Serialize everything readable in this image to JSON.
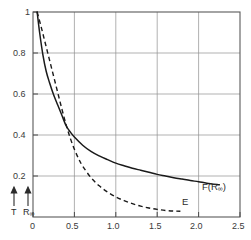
{
  "chart_data": {
    "type": "line",
    "title": "",
    "xlabel": "",
    "ylabel": "",
    "xlim": [
      0,
      2.5
    ],
    "ylim": [
      0,
      1.05
    ],
    "grid": true,
    "legend_position": "inline-right",
    "x_ticks": [
      "0",
      "0.5",
      "1.0",
      "1.5",
      "2.0",
      "2.5"
    ],
    "x_tick_values": [
      0,
      0.5,
      1.0,
      1.5,
      2.0,
      2.5
    ],
    "y_ticks": [
      "0.2",
      "0.4",
      "0.6",
      "0.8",
      "1"
    ],
    "y_tick_values": [
      0.2,
      0.4,
      0.6,
      0.8,
      1.0
    ],
    "series": [
      {
        "name": "F(R∞)",
        "label": "F(R",
        "label_sub": "∞",
        "label_tail": ")",
        "style": "solid",
        "color": "#1a1a1a",
        "x": [
          0.05,
          0.08,
          0.12,
          0.16,
          0.2,
          0.25,
          0.3,
          0.35,
          0.4,
          0.45,
          0.5,
          0.6,
          0.7,
          0.8,
          0.9,
          1.0,
          1.1,
          1.2,
          1.3,
          1.4,
          1.5,
          1.6,
          1.7,
          1.8,
          1.9,
          2.0,
          2.1,
          2.25
        ],
        "y": [
          1.0,
          0.9,
          0.79,
          0.71,
          0.655,
          0.595,
          0.545,
          0.495,
          0.445,
          0.415,
          0.39,
          0.35,
          0.32,
          0.298,
          0.28,
          0.263,
          0.25,
          0.238,
          0.228,
          0.218,
          0.208,
          0.2,
          0.192,
          0.185,
          0.178,
          0.172,
          0.165,
          0.157
        ]
      },
      {
        "name": "E",
        "label": "E",
        "style": "dashed",
        "color": "#1a1a1a",
        "x": [
          0.05,
          0.1,
          0.15,
          0.2,
          0.25,
          0.3,
          0.35,
          0.4,
          0.45,
          0.5,
          0.55,
          0.6,
          0.7,
          0.8,
          0.9,
          1.0,
          1.1,
          1.2,
          1.3,
          1.4,
          1.5,
          1.6,
          1.7,
          1.78
        ],
        "y": [
          1.0,
          0.925,
          0.845,
          0.765,
          0.685,
          0.605,
          0.525,
          0.45,
          0.385,
          0.33,
          0.285,
          0.248,
          0.192,
          0.152,
          0.122,
          0.098,
          0.08,
          0.065,
          0.053,
          0.044,
          0.037,
          0.032,
          0.029,
          0.028
        ]
      }
    ],
    "annotations": [
      {
        "name": "T",
        "label": "T",
        "x": 0.02,
        "arrow": "up"
      },
      {
        "name": "R-infinity",
        "label": "R",
        "label_sub": "∞",
        "x": 0.16,
        "arrow": "up"
      }
    ],
    "colors": {
      "axis": "#5a5a5a",
      "grid": "#8f8f8f",
      "curve": "#1a1a1a",
      "text": "#2b2b2b",
      "background": "#ffffff"
    }
  }
}
